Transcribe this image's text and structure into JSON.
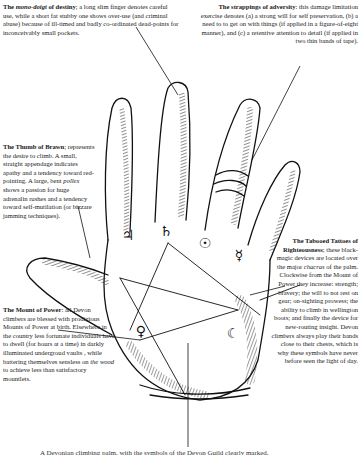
{
  "figure": {
    "symbols": [
      {
        "name": "jupiter-symbol",
        "glyph": "♃"
      },
      {
        "name": "saturn-symbol",
        "glyph": "♄"
      },
      {
        "name": "sun-symbol",
        "glyph": "☉"
      },
      {
        "name": "mercury-symbol",
        "glyph": "☿"
      },
      {
        "name": "venus-symbol",
        "glyph": "♀"
      },
      {
        "name": "moon-symbol",
        "glyph": "☾"
      }
    ]
  },
  "annotations": {
    "mono_doigt": {
      "title_pre": "The ",
      "title_italic": "mono-doigt",
      "title_post": " of destiny",
      "body": "; a long slim finger denotes careful use, while a short fat stubby one shows over-use (and criminal abuse) because of ill-timed and badly co-ordinated dead-points for inconceivably small pockets."
    },
    "strappings": {
      "title": "The strappings of adversity",
      "body": ": this damage limitation exercise denotes (a) a strong will for self preservation, (b) a need to to get on with things (if applied in a figure-of-eight manner), and (c) a retentive attention to detail (if applied in two thin bands of tape)."
    },
    "thumb": {
      "title": "The Thumb of Brawn",
      "body_1": "; represents the desire to climb. A small, straight appendage indicates apathy and a tendency toward red-pointing. A large, bent ",
      "body_italic": "pollex",
      "body_2": " shows a passion for huge adrenalin rushes and a tendency toward self-mutilation (or bizzare jamming techniques)."
    },
    "tattoos": {
      "title": "The Tabooed Tattoes of Righteousness",
      "body_1": "; these black-magic devices are located over the major ",
      "body_italic": "chacras",
      "body_2": " of the palm. Clockwise from the Mount of Power they increase: strength; bravery; the will to not rest on gear; on-sighting prowess; the ability to climb in wellington boots; and finally the device for new-routing insight. Devon climbers always play their hands close to their chests, which is why these symbols have never before seen the light of day."
    },
    "mount": {
      "title": "The Mount of Power",
      "body_1": ": all Devon climbers are blessed with prodigious Mounts of Power at birth. Elsewhere in the country less fortunate individuals have to dwell (for hours at a time) in darkly illuminated undergroud vaults , while battering themselves sensless on ",
      "body_italic": "the wood",
      "body_2": " to achieve less than satisfactory mountlets."
    }
  },
  "caption": {
    "text": "A Devonian climbing palm, with the symbols of the Devon Guild clearly marked."
  },
  "colors": {
    "ink": "#1a1a1a",
    "paper": "#ffffff"
  }
}
